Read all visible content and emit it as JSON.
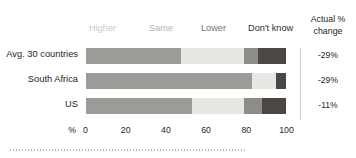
{
  "chart_data": {
    "type": "bar",
    "orientation": "horizontal",
    "stacked": true,
    "title": "",
    "subtitle": "",
    "xlabel": "%",
    "ylabel": "",
    "xlim": [
      0,
      100
    ],
    "xticks": [
      "0",
      "20",
      "40",
      "60",
      "80",
      "100"
    ],
    "grid": false,
    "legend_position": "top",
    "categories": [
      "Avg. 30 countries",
      "South Africa",
      "US"
    ],
    "series": [
      {
        "name": "Higher",
        "color": "#9d9b98",
        "values": [
          47.5,
          83,
          53
        ]
      },
      {
        "name": "Same",
        "color": "#e8e7e4",
        "values": [
          31.5,
          12,
          26
        ]
      },
      {
        "name": "Lower",
        "color": "#8e8c89",
        "values": [
          7,
          0,
          9
        ]
      },
      {
        "name": "Don't know",
        "color": "#4a4745",
        "values": [
          14,
          5,
          12
        ]
      }
    ],
    "annotations": {
      "right_column_header": "Actual % change",
      "right_column_values": [
        "-29%",
        "-29%",
        "-11%"
      ]
    }
  },
  "legend": {
    "items": [
      {
        "label": "Higher",
        "swatch": "#c9c9c9"
      },
      {
        "label": "Same",
        "swatch": "#b4b4b4"
      },
      {
        "label": "Lower",
        "swatch": "#77746f"
      },
      {
        "label": "Don't know",
        "swatch": "#322f2c"
      }
    ]
  },
  "right_column": {
    "header_line1": "Actual %",
    "header_line2": "change",
    "values": [
      "-29%",
      "-29%",
      "-11%"
    ]
  },
  "axis": {
    "unit": "%",
    "ticks": [
      "0",
      "20",
      "40",
      "60",
      "80",
      "100"
    ]
  },
  "rows": [
    {
      "label": "Avg. 30 countries",
      "value": "-29%"
    },
    {
      "label": "South Africa",
      "value": "-29%"
    },
    {
      "label": "US",
      "value": "-11%"
    }
  ]
}
